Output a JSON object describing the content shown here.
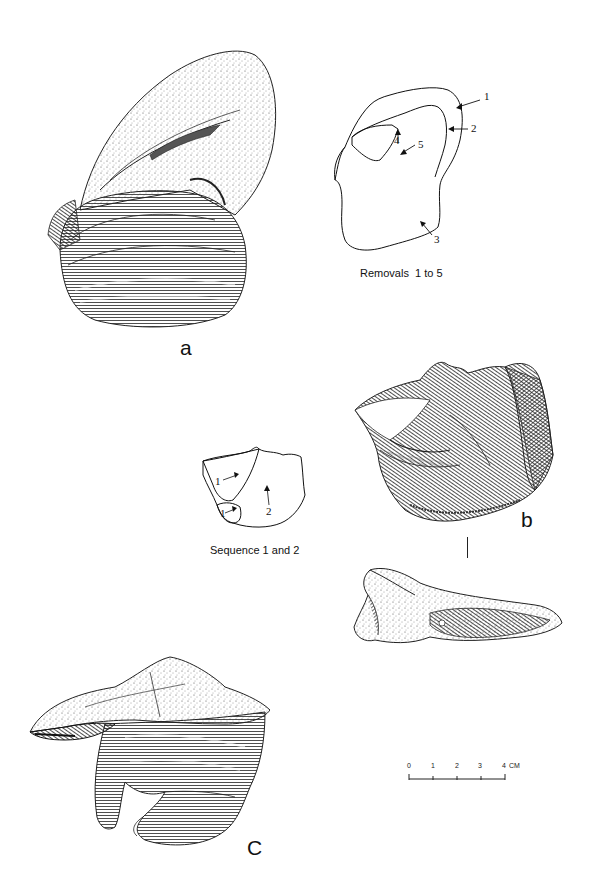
{
  "figures": {
    "a": {
      "label": "a",
      "schematic": {
        "caption": "Removals  1 to 5",
        "removals": [
          "1",
          "2",
          "3",
          "4",
          "5"
        ]
      }
    },
    "b": {
      "label": "b",
      "schematic": {
        "caption": "Sequence 1 and 2",
        "sequence": [
          "1",
          "1",
          "2"
        ]
      }
    },
    "c": {
      "label": "C"
    }
  },
  "scale_bar": {
    "ticks": [
      "0",
      "1",
      "2",
      "3",
      "4"
    ],
    "unit": "CM"
  },
  "colors": {
    "ink": "#1a1a1a",
    "paper": "#ffffff"
  }
}
